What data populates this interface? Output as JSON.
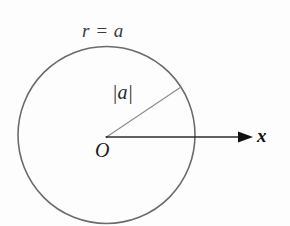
{
  "figure": {
    "background_color": "#fdfdfd",
    "width": 290,
    "height": 226,
    "labels": {
      "circle_equation": "r = a",
      "radius_magnitude": "|a|",
      "origin": "O",
      "x_axis": "x"
    },
    "colors": {
      "circle_stroke": "#6b6b6b",
      "axis_stroke": "#2b2b2b",
      "radius_stroke": "#8a8a8a",
      "text": "#1c1c1c"
    },
    "geometry": {
      "center_x": 106.5,
      "center_y": 135,
      "radius": 88.5,
      "circle_stroke_width": 1.6,
      "axis_start_x": 106.5,
      "axis_end_x": 252,
      "axis_y": 137,
      "axis_stroke_width": 1.5,
      "radius_line_end_x": 181,
      "radius_line_end_y": 87,
      "radius_line_stroke_width": 1.1,
      "arrow_tip_x": 253,
      "arrow_tail_x": 238,
      "arrow_half_height": 5.5
    }
  }
}
